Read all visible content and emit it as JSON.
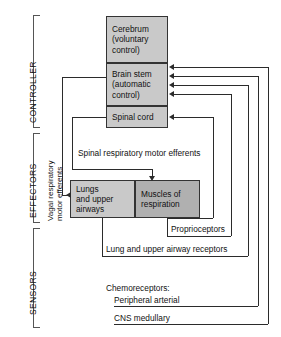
{
  "diagram": {
    "brackets": [
      {
        "id": "controller",
        "label": "CONTROLLER"
      },
      {
        "id": "effectors",
        "label": "EFFECTORS"
      },
      {
        "id": "sensors",
        "label": "SENSORS"
      }
    ],
    "controller_boxes": [
      {
        "id": "cerebrum",
        "lines": [
          "Cerebrum",
          "(voluntary",
          "control)"
        ]
      },
      {
        "id": "brain-stem",
        "lines": [
          "Brain stem",
          "(automatic",
          "control)"
        ]
      },
      {
        "id": "spinal-cord",
        "lines": [
          "Spinal cord"
        ]
      }
    ],
    "effector_boxes": [
      {
        "id": "lungs",
        "lines": [
          "Lungs",
          "and upper",
          "airways"
        ]
      },
      {
        "id": "muscles",
        "lines": [
          "Muscles of",
          "respiration"
        ]
      }
    ],
    "pathways": {
      "vagal": [
        "Vagal respiratory",
        "motor efferents"
      ],
      "spinal_efferents": "Spinal respiratory motor efferents"
    },
    "sensors": [
      {
        "id": "proprioceptors",
        "label": "Proprioceptors"
      },
      {
        "id": "lung-receptors",
        "label": "Lung and upper airway receptors"
      },
      {
        "id": "chemoreceptors",
        "label": "Chemoreceptors:"
      },
      {
        "id": "peripheral-arterial",
        "label": "Peripheral arterial"
      },
      {
        "id": "cns-medullary",
        "label": "CNS medullary"
      }
    ],
    "colors": {
      "box_light": "#c9c9c9",
      "box_dark": "#b0b0b0",
      "line": "#2b2b2b",
      "bracket": "#555555",
      "background": "#ffffff"
    }
  }
}
